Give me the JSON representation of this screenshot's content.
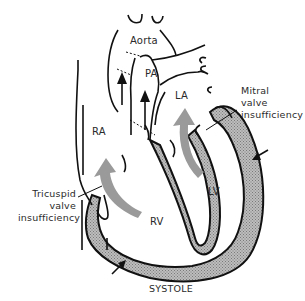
{
  "diagram": {
    "title": "SYSTOLE",
    "chambers": {
      "aorta": "Aorta",
      "pa": "PA",
      "la": "LA",
      "ra": "RA",
      "rv": "RV",
      "lv": "LV"
    },
    "annotations": {
      "mitral": [
        "Mitral",
        "valve",
        "insufficiency"
      ],
      "tricuspid": [
        "Tricuspid",
        "valve",
        "insufficiency"
      ]
    },
    "colors": {
      "outline": "#111111",
      "myocardium_fill": "#a8a8a8",
      "regurgitant_flow": "#9a9a9a",
      "background": "#ffffff",
      "text": "#2a2a2a"
    },
    "icons": {
      "flow_arrows": "regurgitant-flow-arrow",
      "compression_arrows": "contraction-arrow"
    }
  }
}
